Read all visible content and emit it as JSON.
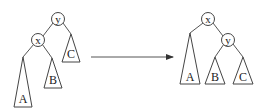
{
  "diagram": {
    "type": "tree-rotation",
    "left_tree": {
      "root": "y",
      "child": "x",
      "subtrees": [
        "A",
        "B",
        "C"
      ]
    },
    "arrow": "right",
    "right_tree": {
      "root": "x",
      "child": "y",
      "subtrees": [
        "A",
        "B",
        "C"
      ]
    }
  },
  "labels": {
    "left_root": "y",
    "left_child": "x",
    "left_A": "A",
    "left_B": "B",
    "left_C": "C",
    "right_root": "x",
    "right_child": "y",
    "right_A": "A",
    "right_B": "B",
    "right_C": "C"
  },
  "colors": {
    "stroke": "#444444",
    "background": "#ffffff"
  }
}
